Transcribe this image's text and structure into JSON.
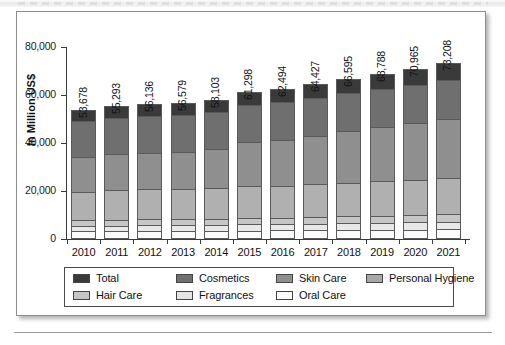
{
  "figure": {
    "y_axis_title": "In Million US$"
  },
  "chart_data": {
    "type": "bar",
    "stacked": true,
    "title": "",
    "xlabel": "",
    "ylabel": "In Million US$",
    "ylim": [
      0,
      80000
    ],
    "yticks": [
      "0",
      "20,000",
      "40,000",
      "60,000",
      "80,000"
    ],
    "ytick_values": [
      0,
      20000,
      40000,
      60000,
      80000
    ],
    "grid": false,
    "legend_position": "bottom",
    "categories": [
      "2010",
      "2011",
      "2012",
      "2013",
      "2014",
      "2015",
      "2016",
      "2017",
      "2018",
      "2019",
      "2020",
      "2021"
    ],
    "totals": [
      53678,
      55293,
      56136,
      56579,
      58103,
      61298,
      62494,
      64427,
      66595,
      68788,
      70965,
      73208
    ],
    "total_labels": [
      "53,678",
      "55,293",
      "56,136",
      "56,579",
      "58,103",
      "61,298",
      "62,494",
      "64,427",
      "66,595",
      "68,788",
      "70,965",
      "73,208"
    ],
    "series": [
      {
        "name": "Oral Care",
        "color": "#fbfbfb",
        "values": [
          3200,
          3250,
          3300,
          3350,
          3400,
          3500,
          3550,
          3650,
          3750,
          3850,
          3950,
          4050
        ]
      },
      {
        "name": "Fragrances",
        "color": "#e8e8e8",
        "values": [
          2300,
          2350,
          2400,
          2450,
          2500,
          2600,
          2650,
          2750,
          2850,
          2900,
          3000,
          3100
        ]
      },
      {
        "name": "Hair Care",
        "color": "#c6c6c6",
        "values": [
          2400,
          2450,
          2500,
          2550,
          2600,
          2700,
          2750,
          2850,
          2950,
          3050,
          3150,
          3250
        ]
      },
      {
        "name": "Personal Hygiene",
        "color": "#b0b0b0",
        "values": [
          11900,
          12350,
          12500,
          12600,
          12800,
          13200,
          13350,
          13600,
          13950,
          14250,
          14700,
          15100
        ]
      },
      {
        "name": "Skin Care",
        "color": "#8f8f8f",
        "values": [
          14400,
          14900,
          15200,
          15400,
          16100,
          18600,
          19100,
          20200,
          21500,
          22700,
          23600,
          24600
        ]
      },
      {
        "name": "Cosmetics",
        "color": "#6f6f6f",
        "values": [
          14900,
          15200,
          15300,
          15300,
          15400,
          15400,
          15550,
          15600,
          15700,
          15900,
          16000,
          16000
        ]
      },
      {
        "name": "Total",
        "color": "#3a3a3a",
        "values": [
          4578,
          4793,
          4936,
          4929,
          5303,
          5298,
          5544,
          5777,
          5895,
          6138,
          6565,
          7108
        ]
      }
    ],
    "legend_entries": [
      {
        "label": "Total",
        "color": "#3a3a3a"
      },
      {
        "label": "Cosmetics",
        "color": "#6f6f6f"
      },
      {
        "label": "Skin Care",
        "color": "#8f8f8f"
      },
      {
        "label": "Personal Hygiene",
        "color": "#a8a8a8"
      },
      {
        "label": "Hair Care",
        "color": "#c6c6c6"
      },
      {
        "label": "Fragrances",
        "color": "#e4e4e4"
      },
      {
        "label": "Oral Care",
        "color": "#fdfdfd"
      }
    ]
  }
}
